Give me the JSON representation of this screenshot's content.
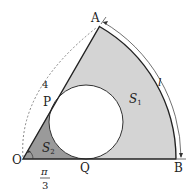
{
  "diagram": {
    "type": "geometry",
    "points": {
      "O": {
        "label": "O"
      },
      "A": {
        "label": "A"
      },
      "B": {
        "label": "B"
      },
      "P": {
        "label": "P"
      },
      "Q": {
        "label": "Q"
      }
    },
    "labels": {
      "radius": "4",
      "arc": "l",
      "region1": "S",
      "region1_sub": "1",
      "region2": "S",
      "region2_sub": "2",
      "angle_num": "π",
      "angle_den": "3"
    },
    "colors": {
      "region1_fill": "#d4d4d4",
      "region2_fill": "#9a9a9a",
      "circle_fill": "#ffffff",
      "stroke": "#222222"
    }
  }
}
